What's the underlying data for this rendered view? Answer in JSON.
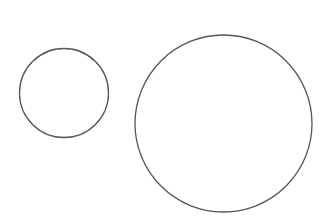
{
  "canvas": {
    "width": 330,
    "height": 224,
    "background": "#ffffff"
  },
  "stroke": {
    "color": "#555555",
    "width": 1.3
  },
  "shapes": [
    {
      "type": "circle",
      "label": "small-circle",
      "cx": 64,
      "cy": 93,
      "r": 44.5
    },
    {
      "type": "circle",
      "label": "large-circle",
      "cx": 223.5,
      "cy": 123.5,
      "r": 88.5
    }
  ]
}
